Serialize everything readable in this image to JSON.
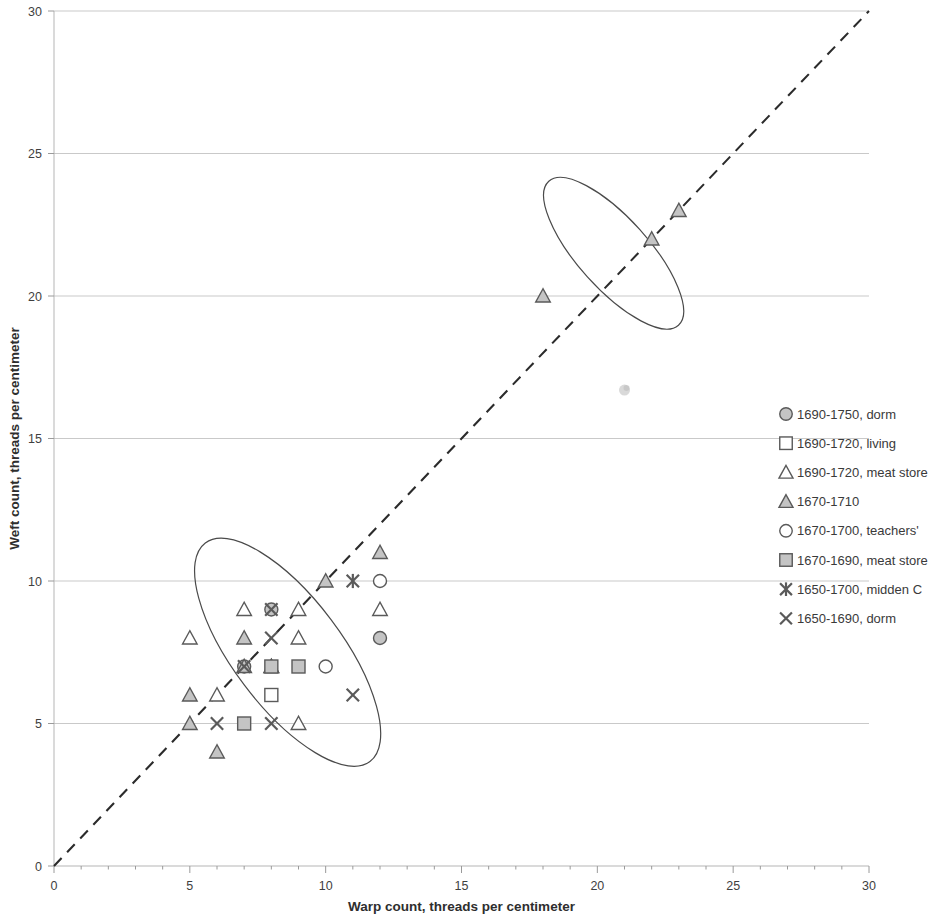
{
  "chart_data": {
    "type": "scatter",
    "title": "",
    "xlabel": "Warp count, threads per centimeter",
    "ylabel": "Weft count, threads per centimeter",
    "xlim": [
      0,
      30
    ],
    "ylim": [
      0,
      30
    ],
    "xticks": [
      0,
      5,
      10,
      15,
      20,
      25,
      30
    ],
    "yticks": [
      0,
      5,
      10,
      15,
      20,
      25,
      30
    ],
    "xtick_labels": [
      "0",
      "5",
      "10",
      "15",
      "20",
      "25",
      "30"
    ],
    "ytick_labels": [
      "0",
      "5",
      "10",
      "15",
      "20",
      "25",
      "30"
    ],
    "grid": "horizontal",
    "legend_position": "right",
    "annotations": [
      {
        "name": "reference-line",
        "type": "dashed-diagonal",
        "from": [
          0,
          0
        ],
        "to": [
          30,
          30
        ],
        "label": "1:1 line"
      },
      {
        "name": "lower-cluster-ellipse",
        "type": "ellipse",
        "center": [
          8.6,
          7.5
        ],
        "rx": 2.0,
        "ry": 4.8,
        "rotation_deg": -37
      },
      {
        "name": "upper-cluster-ellipse",
        "type": "ellipse",
        "center": [
          20.6,
          21.5
        ],
        "rx": 1.3,
        "ry": 3.4,
        "rotation_deg": -42
      },
      {
        "name": "faint-smudge",
        "type": "artifact",
        "at": [
          21.0,
          16.7
        ]
      }
    ],
    "series": [
      {
        "name": "1690-1750, dorm",
        "marker": "circle-filled",
        "points": [
          [
            7,
            7
          ],
          [
            8,
            9
          ],
          [
            12,
            8
          ]
        ]
      },
      {
        "name": "1690-1720, living",
        "marker": "square-open",
        "points": [
          [
            8,
            6
          ]
        ]
      },
      {
        "name": "1690-1720, meat store",
        "marker": "triangle-open",
        "points": [
          [
            5,
            8
          ],
          [
            6,
            6
          ],
          [
            7,
            9
          ],
          [
            8,
            7
          ],
          [
            9,
            8
          ],
          [
            9,
            9
          ],
          [
            9,
            5
          ],
          [
            12,
            9
          ]
        ]
      },
      {
        "name": "1670-1710",
        "marker": "triangle-filled",
        "points": [
          [
            5,
            5
          ],
          [
            6,
            4
          ],
          [
            5,
            6
          ],
          [
            7,
            8
          ],
          [
            7,
            7
          ],
          [
            8,
            7
          ],
          [
            10,
            10
          ],
          [
            12,
            11
          ],
          [
            18,
            20
          ],
          [
            22,
            22
          ],
          [
            23,
            23
          ]
        ]
      },
      {
        "name": "1670-1700, teachers'",
        "marker": "circle-open",
        "points": [
          [
            10,
            7
          ],
          [
            12,
            10
          ]
        ]
      },
      {
        "name": "1670-1690, meat store",
        "marker": "square-filled",
        "points": [
          [
            7,
            5
          ],
          [
            9,
            7
          ],
          [
            8,
            7
          ]
        ]
      },
      {
        "name": "1650-1700, midden C",
        "marker": "asterisk-x",
        "points": [
          [
            11,
            10
          ]
        ]
      },
      {
        "name": "1650-1690, dorm",
        "marker": "cross-x",
        "points": [
          [
            6,
            5
          ],
          [
            8,
            5
          ],
          [
            8,
            8
          ],
          [
            7,
            7
          ],
          [
            8,
            9
          ],
          [
            11,
            6
          ]
        ]
      }
    ]
  },
  "axes": {
    "x_title": "Warp count, threads per centimeter",
    "y_title": "Weft count, threads per centimeter",
    "x_tick_labels": [
      "0",
      "5",
      "10",
      "15",
      "20",
      "25",
      "30"
    ],
    "y_tick_labels": [
      "0",
      "5",
      "10",
      "15",
      "20",
      "25",
      "30"
    ]
  },
  "legend": {
    "items": [
      {
        "label": "1690-1750, dorm",
        "marker": "circle-filled"
      },
      {
        "label": "1690-1720, living",
        "marker": "square-open"
      },
      {
        "label": "1690-1720, meat store",
        "marker": "triangle-open"
      },
      {
        "label": "1670-1710",
        "marker": "triangle-filled"
      },
      {
        "label": "1670-1700, teachers'",
        "marker": "circle-open"
      },
      {
        "label": "1670-1690, meat store",
        "marker": "square-filled"
      },
      {
        "label": "1650-1700, midden C",
        "marker": "asterisk-x"
      },
      {
        "label": "1650-1690, dorm",
        "marker": "cross-x"
      }
    ]
  },
  "colors": {
    "marker_stroke": "#5a5a5a",
    "marker_fill": "#c4c4c4",
    "grid": "#c9c9c9",
    "reference_line": "#2b2b2b",
    "ellipse": "#4a4a4a",
    "text": "#3a3a3a"
  }
}
